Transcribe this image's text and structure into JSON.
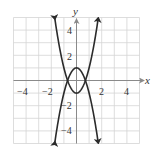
{
  "chart_data": {
    "type": "line",
    "title": "",
    "xlabel": "x",
    "ylabel": "y",
    "xlim": [
      -5,
      5
    ],
    "ylim": [
      -5,
      5
    ],
    "grid": true,
    "x_ticks": [
      {
        "value": -4,
        "label": "−4"
      },
      {
        "value": -2,
        "label": "−2"
      },
      {
        "value": 2,
        "label": "2"
      },
      {
        "value": 4,
        "label": "4"
      }
    ],
    "y_ticks": [
      {
        "value": 4,
        "label": "4"
      },
      {
        "value": 2,
        "label": "2"
      },
      {
        "value": -2,
        "label": "−2"
      },
      {
        "value": -4,
        "label": "−4"
      }
    ],
    "series": [
      {
        "name": "upward parabola",
        "equation": "y = 2x^2 - 1",
        "x_range": [
          -1.72,
          1.72
        ],
        "vertex": [
          0,
          -1
        ],
        "arrows": true,
        "points": [
          [
            -1.7,
            4.78
          ],
          [
            -1.5,
            3.5
          ],
          [
            -1,
            1
          ],
          [
            -0.707,
            0
          ],
          [
            -0.5,
            -0.5
          ],
          [
            0,
            -1
          ],
          [
            0.5,
            -0.5
          ],
          [
            0.707,
            0
          ],
          [
            1,
            1
          ],
          [
            1.5,
            3.5
          ],
          [
            1.7,
            4.78
          ]
        ]
      },
      {
        "name": "downward parabola",
        "equation": "y = 1 - 2x^2",
        "x_range": [
          -1.72,
          1.72
        ],
        "vertex": [
          0,
          1
        ],
        "arrows": true,
        "points": [
          [
            -1.7,
            -4.78
          ],
          [
            -1.5,
            -3.5
          ],
          [
            -1,
            -1
          ],
          [
            -0.707,
            0
          ],
          [
            -0.5,
            0.5
          ],
          [
            0,
            1
          ],
          [
            0.5,
            0.5
          ],
          [
            0.707,
            0
          ],
          [
            1,
            -1
          ],
          [
            1.5,
            -3.5
          ],
          [
            1.7,
            -4.78
          ]
        ]
      }
    ],
    "intersections": [
      [
        -0.707,
        0
      ],
      [
        0.707,
        0
      ]
    ],
    "legend": null
  },
  "labels": {
    "x_axis": "x",
    "y_axis": "y",
    "x_ticks": [
      "−4",
      "−2",
      "2",
      "4"
    ],
    "y_ticks": [
      "4",
      "2",
      "−2",
      "−4"
    ]
  },
  "colors": {
    "curve": "#2b2b2b",
    "grid": "#d4d4d4",
    "axis": "#8a8a8a"
  }
}
